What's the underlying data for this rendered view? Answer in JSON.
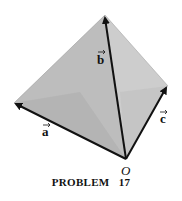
{
  "figure": {
    "vertices": {
      "origin": [
        126,
        159
      ],
      "apex": [
        105,
        15
      ],
      "left": [
        14,
        103
      ],
      "right": [
        168,
        86
      ]
    },
    "faces": {
      "left_face_color": "#b9b9b9",
      "right_face_color": "#cfcfcf",
      "bottom_face_color": "#a9a9a9"
    },
    "vectors": [
      {
        "name": "a",
        "label": "a",
        "from": "origin",
        "to": "left"
      },
      {
        "name": "b",
        "label": "b",
        "from": "origin",
        "to": "apex"
      },
      {
        "name": "c",
        "label": "c",
        "from": "origin",
        "to": "right"
      }
    ],
    "origin_label": "O",
    "arrow_color": "#111111"
  },
  "caption": "PROBLEM   17"
}
